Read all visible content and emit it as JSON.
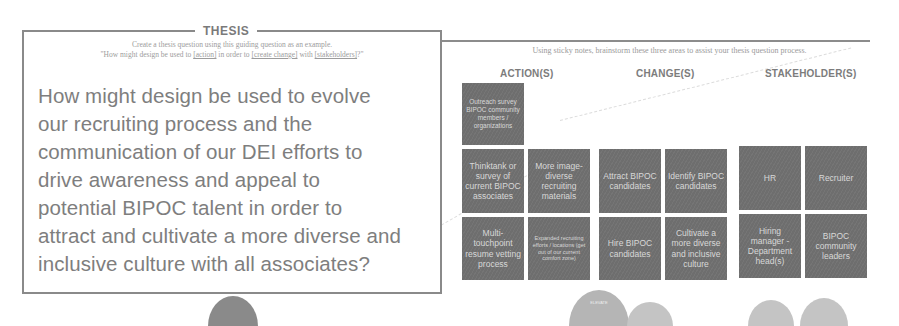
{
  "thesis": {
    "title": "THESIS",
    "subtitle_line1": "Create a thesis question using this guiding question as an example.",
    "subtitle_line2_prefix": "\"How might design be used to ",
    "subtitle_action": "[action]",
    "subtitle_mid1": " in order to ",
    "subtitle_change": "[create change]",
    "subtitle_mid2": " with ",
    "subtitle_stakeholders": "[stakeholders]",
    "subtitle_suffix": "?\"",
    "question_lines": [
      "How might design be used to evolve",
      "our recruiting process and the",
      "communication of our DEI efforts to",
      "drive awareness and appeal to",
      "potential BIPOC talent in order to",
      "attract and cultivate a more diverse and",
      "inclusive culture with all associates?"
    ]
  },
  "board": {
    "intro": "Using sticky notes, brainstorm these three areas to assist your thesis question process.",
    "columns": [
      {
        "heading": "ACTION(S)",
        "notes": [
          "Outreach survey BIPOC community members / organizations",
          "Thinktank or survey of current BIPOC associates",
          "More image-diverse recruiting materials",
          "Multi-touchpoint resume vetting process",
          "Expanded recruiting efforts / locations (get out of our current comfort zone)"
        ]
      },
      {
        "heading": "CHANGE(S)",
        "notes": [
          "Attract BIPOC candidates",
          "Identify BIPOC candidates",
          "Hire BIPOC candidates",
          "Cultivate a more diverse and inclusive culture"
        ]
      },
      {
        "heading": "STAKEHOLDER(S)",
        "notes": [
          "HR",
          "Recruiter",
          "Hiring manager - Department head(s)",
          "BIPOC community leaders"
        ]
      }
    ],
    "circle_label": "ELEVATE"
  },
  "colors": {
    "sticky": "#6e6e6e",
    "border": "#8a8a8a",
    "text": "#7e7e7e"
  }
}
